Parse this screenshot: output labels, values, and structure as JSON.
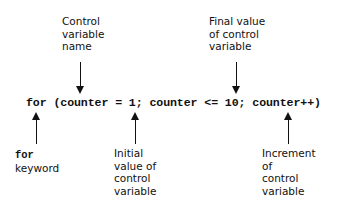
{
  "code": "for (counter = 1; counter <= 10; counter++)",
  "labels": {
    "control_var_name": [
      "Control",
      "variable",
      "name"
    ],
    "final_value": [
      "Final value",
      "of control",
      "variable"
    ],
    "for_keyword": {
      "kw": "for",
      "text": "keyword"
    },
    "initial_value": [
      "Initial",
      "value of",
      "control",
      "variable"
    ],
    "increment": [
      "Increment",
      "of",
      "control",
      "variable"
    ]
  }
}
